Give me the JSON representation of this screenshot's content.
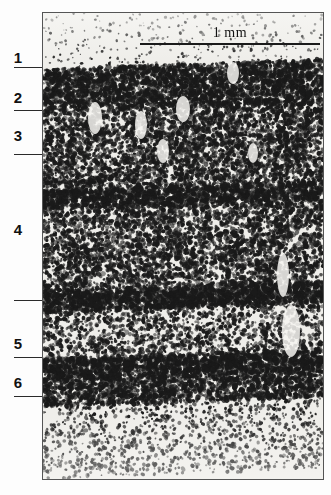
{
  "figure": {
    "kind": "histology-micrograph",
    "panel": {
      "left": 42,
      "top": 12,
      "width": 280,
      "height": 466
    },
    "background_color": "#efeeea",
    "border_color": "#555555",
    "ink_color": "#1a1a1a"
  },
  "scalebar": {
    "label": "1 mm",
    "left": 97,
    "top": 30,
    "width": 180,
    "thickness": 2.2,
    "color": "#1a1a1a"
  },
  "layers": [
    {
      "label": "1",
      "label_y": 50,
      "tick_y": 67
    },
    {
      "label": "2",
      "label_y": 90,
      "tick_y": 110
    },
    {
      "label": "3",
      "label_y": 128,
      "tick_y": 154
    },
    {
      "label": "4",
      "label_y": 222,
      "tick_y": 300
    },
    {
      "label": "5",
      "label_y": 336,
      "tick_y": 357
    },
    {
      "label": "6",
      "label_y": 375,
      "tick_y": 396
    }
  ],
  "ticks": {
    "left": 14,
    "right": 44,
    "color": "#2a2a2a"
  },
  "bands": [
    {
      "name": "layer-1-molecular",
      "top": 0,
      "height": 56,
      "density": 0.06,
      "dot": 1.1
    },
    {
      "name": "layer-2-external-granular",
      "top": 56,
      "height": 44,
      "density": 0.72,
      "dot": 1.9
    },
    {
      "name": "layer-3-external-pyramidal",
      "top": 100,
      "height": 78,
      "density": 0.5,
      "dot": 1.8
    },
    {
      "name": "layer-4-internal-granular",
      "top": 178,
      "height": 18,
      "density": 0.8,
      "dot": 2.0
    },
    {
      "name": "layer-4b-sublayer",
      "top": 196,
      "height": 82,
      "density": 0.46,
      "dot": 1.8
    },
    {
      "name": "layer-4c-dense-band",
      "top": 278,
      "height": 22,
      "density": 0.84,
      "dot": 2.0
    },
    {
      "name": "layer-5-internal-pyramidal",
      "top": 300,
      "height": 46,
      "density": 0.3,
      "dot": 1.7
    },
    {
      "name": "layer-5b-dense-band",
      "top": 346,
      "height": 22,
      "density": 0.82,
      "dot": 2.0
    },
    {
      "name": "layer-6-multiform",
      "top": 368,
      "height": 26,
      "density": 0.62,
      "dot": 1.9
    },
    {
      "name": "white-matter-transition",
      "top": 394,
      "height": 72,
      "density": 0.16,
      "dot": 1.5
    }
  ]
}
